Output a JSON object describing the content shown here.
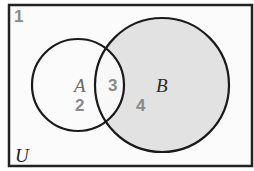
{
  "diagram": {
    "type": "venn",
    "universe": {
      "label": "U",
      "region_number": "1",
      "fill": "#fbfbfb",
      "stroke": "#222222"
    },
    "sets": [
      {
        "id": "A",
        "label": "A",
        "shaded": false,
        "label_color": "#6a6a6a"
      },
      {
        "id": "B",
        "label": "B",
        "shaded": true,
        "label_color": "#2a2a2a"
      }
    ],
    "regions": [
      {
        "number": "1",
        "description": "outside A and B",
        "shaded": false
      },
      {
        "number": "2",
        "description": "A only",
        "shaded": false
      },
      {
        "number": "3",
        "description": "A and B",
        "shaded": false
      },
      {
        "number": "4",
        "description": "B only",
        "shaded": true
      }
    ],
    "colors": {
      "shade": "#e2e2e2",
      "number_text": "#8a8a8a",
      "outline": "#1a1a1a"
    }
  }
}
